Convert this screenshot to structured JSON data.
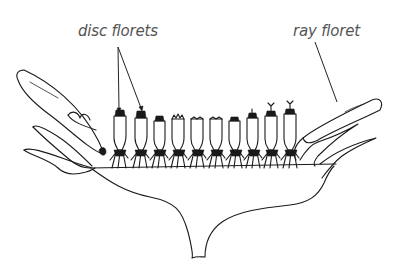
{
  "diagram": {
    "labels": {
      "disc_florets": "disc florets",
      "ray_floret": "ray floret"
    },
    "colors": {
      "ink": "#1a1a1a",
      "label_text": "#555555",
      "background": "#ffffff"
    },
    "parts": [
      "disc florets",
      "ray floret",
      "bracts",
      "receptacle",
      "stem"
    ],
    "disc_floret_count": 10
  }
}
